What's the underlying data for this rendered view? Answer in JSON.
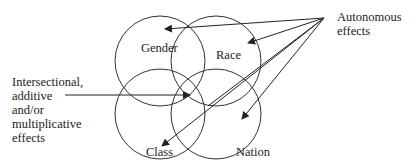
{
  "circles": [
    {
      "label": "Gender"
    },
    {
      "label": "Race"
    },
    {
      "label": "Class"
    },
    {
      "label": "Nation"
    }
  ],
  "annotations": {
    "intersectional": [
      "Intersectional,",
      "additive",
      "and/or",
      "multiplicative",
      "effects"
    ],
    "autonomous": [
      "Autonomous",
      "effects"
    ]
  },
  "colors": {
    "stroke": "#222222",
    "background": "#ffffff"
  }
}
